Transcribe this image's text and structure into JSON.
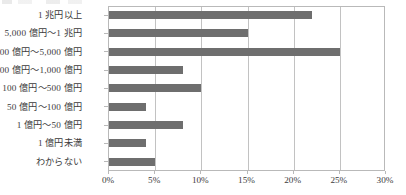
{
  "chart_data": {
    "type": "bar",
    "orientation": "horizontal",
    "title": "",
    "xlabel": "",
    "ylabel": "",
    "xlim": [
      0,
      30
    ],
    "xticks": [
      0,
      5,
      10,
      15,
      20,
      25,
      30
    ],
    "xtick_labels": [
      "0%",
      "5%",
      "10%",
      "15%",
      "20%",
      "25%",
      "30%"
    ],
    "grid": true,
    "legend": "none",
    "bar_color": "#6e6e6e",
    "axis_color": "#b9b9b9",
    "categories": [
      "1 兆円以上",
      "5,000 億円〜1 兆円",
      "1,000 億円〜5,000 億円",
      "500 億円〜1,000 億円",
      "100 億円〜500 億円",
      "50 億円〜100 億円",
      "1 億円〜50 億円",
      "1 億円未満",
      "わからない"
    ],
    "values": [
      22,
      15,
      25,
      8,
      10,
      4,
      8,
      4,
      5
    ],
    "value_unit": "%"
  }
}
